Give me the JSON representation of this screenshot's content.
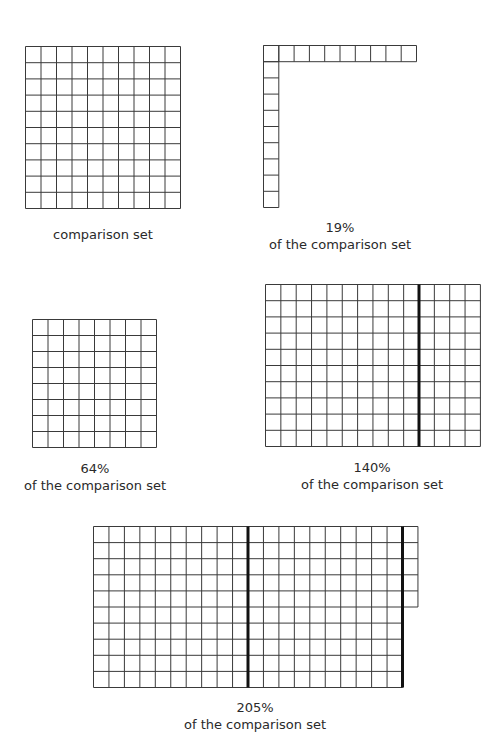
{
  "figures": [
    {
      "id": "comparison",
      "label_line1": "comparison set",
      "label_line2": "",
      "cols": 10,
      "rows": 10,
      "shape": "square",
      "total_cells": 100
    },
    {
      "id": "pct19",
      "label_line1": "19%",
      "label_line2": "of the comparison set",
      "shape": "L",
      "top_row_cells": 10,
      "left_col_cells": 10,
      "total_cells": 19
    },
    {
      "id": "pct64",
      "label_line1": "64%",
      "label_line2": "of the comparison set",
      "cols": 8,
      "rows": 8,
      "shape": "square",
      "total_cells": 64
    },
    {
      "id": "pct140",
      "label_line1": "140%",
      "label_line2": "of the comparison set",
      "cols": 14,
      "rows": 10,
      "thick_after_cols": [
        10
      ],
      "total_cells": 140
    },
    {
      "id": "pct205",
      "label_line1": "205%",
      "label_line2": "of the comparison set",
      "cols": 20,
      "rows": 10,
      "extra_col_rows": 5,
      "thick_after_cols": [
        10,
        20
      ],
      "total_cells": 205
    }
  ],
  "chart_data": {
    "type": "grid-diagram",
    "title": "",
    "categories": [
      "comparison set",
      "19%",
      "64%",
      "140%",
      "205%"
    ],
    "values": [
      100,
      19,
      64,
      140,
      205
    ],
    "unit": "squares (percent of 100-square comparison set)"
  }
}
